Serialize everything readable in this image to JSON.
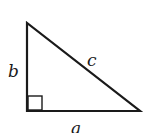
{
  "diagram": {
    "type": "right-triangle",
    "labels": {
      "a": "a",
      "b": "b",
      "c": "c"
    },
    "vertices": {
      "top": [
        27,
        23
      ],
      "right_angle": [
        27,
        111
      ],
      "right": [
        140,
        111
      ]
    },
    "right_angle_marker": true,
    "stroke_color": "#1a1a1a"
  }
}
